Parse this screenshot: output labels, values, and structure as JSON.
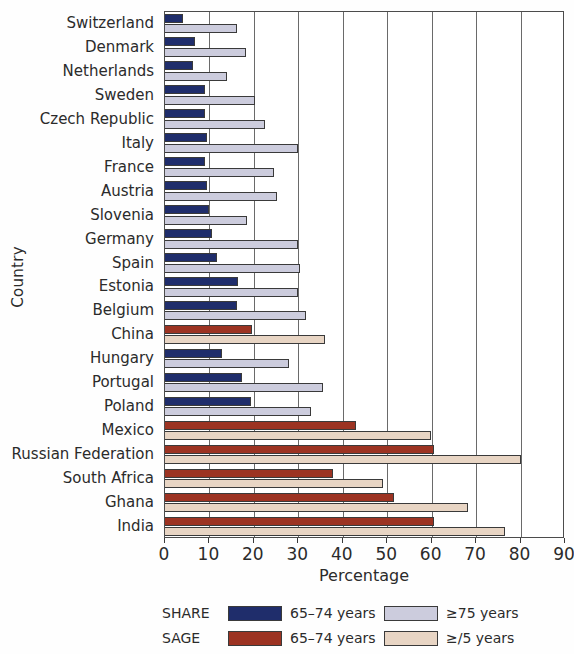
{
  "chart_data": {
    "type": "bar",
    "orientation": "horizontal",
    "title": "",
    "xlabel": "Percentage",
    "ylabel": "Country",
    "xlim": [
      0,
      90
    ],
    "xticks": [
      0,
      10,
      20,
      30,
      40,
      50,
      60,
      70,
      80,
      90
    ],
    "grid": "vertical",
    "legend_position": "bottom",
    "categories": [
      "Switzerland",
      "Denmark",
      "Netherlands",
      "Sweden",
      "Czech Republic",
      "Italy",
      "France",
      "Austria",
      "Slovenia",
      "Germany",
      "Spain",
      "Estonia",
      "Belgium",
      "China",
      "Hungary",
      "Portugal",
      "Poland",
      "Mexico",
      "Russian Federation",
      "South Africa",
      "Ghana",
      "India"
    ],
    "category_study": [
      "SHARE",
      "SHARE",
      "SHARE",
      "SHARE",
      "SHARE",
      "SHARE",
      "SHARE",
      "SHARE",
      "SHARE",
      "SHARE",
      "SHARE",
      "SHARE",
      "SHARE",
      "SAGE",
      "SHARE",
      "SHARE",
      "SHARE",
      "SAGE",
      "SAGE",
      "SAGE",
      "SAGE",
      "SAGE"
    ],
    "series": [
      {
        "name": "65-74 years",
        "key": "young",
        "values": [
          4.1,
          6.8,
          6.4,
          9.1,
          9.1,
          9.4,
          9.1,
          9.4,
          9.8,
          10.5,
          11.6,
          16.4,
          16.2,
          19.5,
          12.8,
          17.3,
          19.4,
          42.9,
          60.5,
          37.8,
          51.6,
          60.5
        ]
      },
      {
        "name": "≥75 years",
        "key": "old",
        "values": [
          16.2,
          18.2,
          13.9,
          20.3,
          22.4,
          29.9,
          24.6,
          25.1,
          18.5,
          29.9,
          30.3,
          30.0,
          31.8,
          35.9,
          27.8,
          35.5,
          32.9,
          59.9,
          80.0,
          49.0,
          68.2,
          76.4
        ]
      }
    ],
    "colors": {
      "share_young": "#1f2d6b",
      "share_old": "#ccccdd",
      "sage_young": "#9c3322",
      "sage_old": "#e8d5c4",
      "axis": "#4c4c4c",
      "grid": "#6a6a6a",
      "text": "#2b2b2b"
    }
  },
  "axes": {
    "x_title": "Percentage",
    "y_title": "Country",
    "x_tick_labels": [
      "0",
      "10",
      "20",
      "30",
      "40",
      "50",
      "60",
      "70",
      "80",
      "90"
    ]
  },
  "legend": {
    "rows": [
      {
        "study": "SHARE",
        "series1_label": "65–74 years",
        "series2_label": "≥75 years"
      },
      {
        "study": "SAGE",
        "series1_label": "65–74 years",
        "series2_label": "≥/5 years"
      }
    ]
  }
}
